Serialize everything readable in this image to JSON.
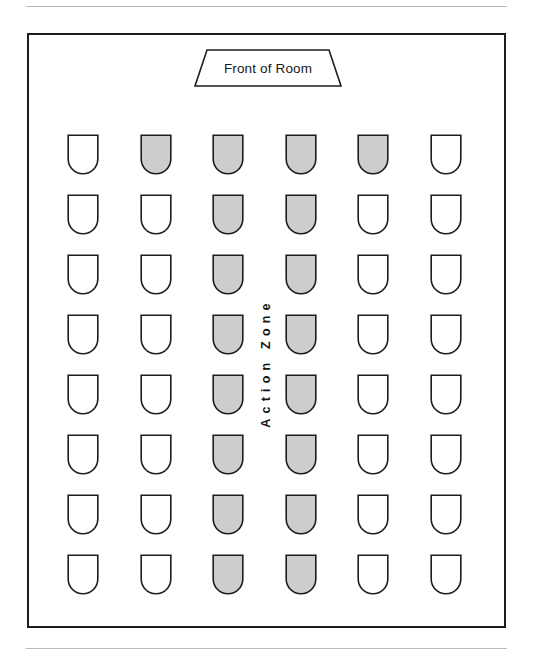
{
  "diagram": {
    "front_label": "Front of Room",
    "zone_label": "Action Zone",
    "colors": {
      "seat_filled": "#cdcdcd",
      "seat_empty": "#ffffff",
      "outline": "#1d1d1d",
      "rule": "#b9b9b9"
    },
    "legend": {
      "filled_meaning": "Seat inside action zone",
      "empty_meaning": "Seat outside action zone"
    },
    "grid": {
      "rows": 8,
      "columns": 6,
      "row_labels": [
        "Row 1",
        "Row 2",
        "Row 3",
        "Row 4",
        "Row 5",
        "Row 6",
        "Row 7",
        "Row 8"
      ],
      "column_labels": [
        "Col 1",
        "Col 2",
        "Col 3",
        "Col 4",
        "Col 5",
        "Col 6"
      ],
      "seat_states": [
        [
          "empty",
          "filled",
          "filled",
          "filled",
          "filled",
          "empty"
        ],
        [
          "empty",
          "empty",
          "filled",
          "filled",
          "empty",
          "empty"
        ],
        [
          "empty",
          "empty",
          "filled",
          "filled",
          "empty",
          "empty"
        ],
        [
          "empty",
          "empty",
          "filled",
          "filled",
          "empty",
          "empty"
        ],
        [
          "empty",
          "empty",
          "filled",
          "filled",
          "empty",
          "empty"
        ],
        [
          "empty",
          "empty",
          "filled",
          "filled",
          "empty",
          "empty"
        ],
        [
          "empty",
          "empty",
          "filled",
          "filled",
          "empty",
          "empty"
        ],
        [
          "empty",
          "empty",
          "filled",
          "filled",
          "empty",
          "empty"
        ]
      ],
      "column_x": [
        66,
        139,
        211,
        284,
        356,
        429
      ],
      "row_y": [
        133,
        193,
        253,
        313,
        373,
        433,
        493,
        553
      ],
      "filled_count": 18,
      "empty_count": 30,
      "total_seats": 48
    }
  }
}
